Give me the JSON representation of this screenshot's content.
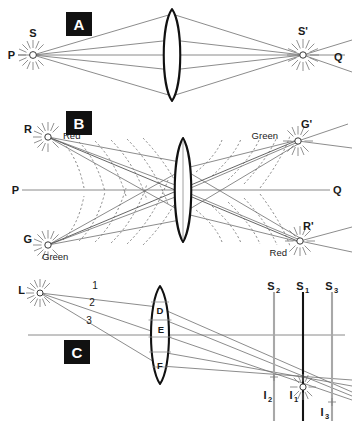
{
  "figure": {
    "background_color": "#ffffff",
    "ink_color": "#1a1a1a",
    "ray_color": "#6f6f6f",
    "axis_color": "#8a8a8a",
    "badge_background": "#111111",
    "badge_text_color": "#ffffff",
    "screen_primary_color": "#141414",
    "screen_secondary_color": "#a8a8a8",
    "width": 357,
    "height": 421
  },
  "panels": [
    {
      "id": "A",
      "badge_label": "A",
      "caption": "Point source S on axis PQ imaged by a converging lens to point S'",
      "axis_left_label": "P",
      "axis_right_label": "Q",
      "source_label": "S",
      "image_label": "S'",
      "element_labels": [
        "P",
        "S",
        "S'",
        "Q"
      ]
    },
    {
      "id": "B",
      "badge_label": "B",
      "caption": "Chromatic aberration: red and green sources cross-imaged through the lens",
      "axis_left_label": "P",
      "axis_right_label": "Q",
      "sources": [
        {
          "point_label": "R",
          "color_label": "Red",
          "position": "top-left"
        },
        {
          "point_label": "G",
          "color_label": "Green",
          "position": "bottom-left"
        }
      ],
      "images": [
        {
          "point_label": "G'",
          "color_label": "Green",
          "position": "top-right"
        },
        {
          "point_label": "R'",
          "color_label": "Red",
          "position": "bottom-right"
        }
      ],
      "element_labels": [
        "R",
        "Red",
        "P",
        "G",
        "Green",
        "Green",
        "G'",
        "Q",
        "Red",
        "R'"
      ]
    },
    {
      "id": "C",
      "badge_label": "C",
      "caption": "Spherical aberration: rays 1, 2, 3 through lens zones D, E, F focus at different screens",
      "source_label": "L",
      "ray_labels": [
        "1",
        "2",
        "3"
      ],
      "lens_zone_labels": [
        "D",
        "E",
        "F"
      ],
      "screens": [
        {
          "label": "S",
          "subscript": "2",
          "style": "secondary"
        },
        {
          "label": "S",
          "subscript": "1",
          "style": "primary"
        },
        {
          "label": "S",
          "subscript": "3",
          "style": "secondary"
        }
      ],
      "images": [
        {
          "label": "I",
          "subscript": "2"
        },
        {
          "label": "I",
          "subscript": "1"
        },
        {
          "label": "I",
          "subscript": "3"
        }
      ],
      "element_labels": [
        "L",
        "1",
        "2",
        "3",
        "D",
        "E",
        "F",
        "S2",
        "S1",
        "S3",
        "I2",
        "I1",
        "I3",
        "C"
      ]
    }
  ],
  "labels": {
    "a_P": "P",
    "a_S": "S",
    "a_Sprime": "S'",
    "a_Q": "Q",
    "a_badge": "A",
    "b_R": "R",
    "b_Red_left": "Red",
    "b_P": "P",
    "b_G": "G",
    "b_Green_left": "Green",
    "b_Green_right": "Green",
    "b_Gprime": "G'",
    "b_Q": "Q",
    "b_Red_right": "Red",
    "b_Rprime": "R'",
    "b_badge": "B",
    "c_L": "L",
    "c_ray1": "1",
    "c_ray2": "2",
    "c_ray3": "3",
    "c_D": "D",
    "c_E": "E",
    "c_F": "F",
    "c_S_base": "S",
    "c_S2_sub": "2",
    "c_S1_sub": "1",
    "c_S3_sub": "3",
    "c_I_base": "I",
    "c_I2_sub": "2",
    "c_I1_sub": "1",
    "c_I3_sub": "3",
    "c_badge": "C"
  }
}
